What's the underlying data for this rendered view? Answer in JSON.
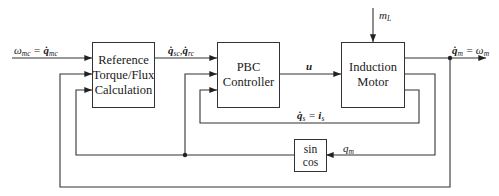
{
  "diagram": {
    "type": "control block diagram",
    "blocks": [
      {
        "id": "ref",
        "line1": "Reference",
        "line2": "Torque/Flux",
        "line3": "Calculation"
      },
      {
        "id": "pbc",
        "line1": "PBC",
        "line2": "Controller"
      },
      {
        "id": "motor",
        "line1": "Induction",
        "line2": "Motor"
      },
      {
        "id": "trig",
        "line1": "sin",
        "line2": "cos"
      }
    ],
    "signals": {
      "input": {
        "omega": "ω",
        "omega_sub": "mc",
        "eq": " = ",
        "q": "q̇",
        "q_sub": "mc"
      },
      "ref_out": {
        "q1": "q̇",
        "q1_sub": "sc",
        "sep": ",",
        "q2": "q̇",
        "q2_sub": "rc"
      },
      "control": "u",
      "load": {
        "m": "m",
        "m_sub": "L"
      },
      "output": {
        "q": "q̇",
        "q_sub": "m",
        "eq": " = ",
        "omega": "ω",
        "omega_sub": "m"
      },
      "current": {
        "q": "q̇",
        "q_sub": "s",
        "eq": " = ",
        "i": "i",
        "i_sub": "s"
      },
      "position": {
        "q": "q",
        "q_sub": "m"
      }
    },
    "colors": {
      "line": "#333333",
      "background": "#ffffff"
    }
  }
}
